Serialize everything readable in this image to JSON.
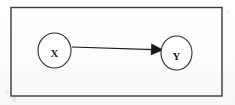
{
  "figure": {
    "kind": "causal-diagram",
    "caption": "",
    "frame": {
      "name": "outer-border-rectangle",
      "x": 11,
      "y": 7.5,
      "width": 211,
      "height": 88.5,
      "stroke_color": "#3a3a3a",
      "stroke_width": 1.4,
      "fill": "none"
    },
    "background_color": "#fdfdfc",
    "ink_color": "#1b1b1b"
  },
  "nodes": [
    {
      "id": "X",
      "label": "X",
      "shape": "circle",
      "cx": 54.5,
      "cy": 50.5,
      "rx": 16.5,
      "ry": 17.5,
      "label_x": 54.5,
      "label_y": 54,
      "stroke_color": "#2c2c2c",
      "stroke_width": 1.1,
      "fill": "#ffffff"
    },
    {
      "id": "Y",
      "label": "Y",
      "shape": "circle",
      "cx": 176.5,
      "cy": 53,
      "rx": 15.5,
      "ry": 17,
      "label_x": 176.5,
      "label_y": 57,
      "stroke_color": "#2c2c2c",
      "stroke_width": 1.1,
      "fill": "#ffffff"
    }
  ],
  "edges": [
    {
      "id": "X-to-Y",
      "from": "X",
      "to": "Y",
      "direction": "right",
      "arrowhead": "filled-triangle",
      "x1": 72,
      "y1": 47,
      "x2": 152,
      "y2": 49.5,
      "stroke_color": "#1b1b1b",
      "stroke_width": 1.2,
      "head_points": "152,44.5 162,49.8 151.5,54.5"
    }
  ],
  "accessibility": {
    "description": "Directed graph with node X pointing to node Y inside a rectangular frame"
  }
}
